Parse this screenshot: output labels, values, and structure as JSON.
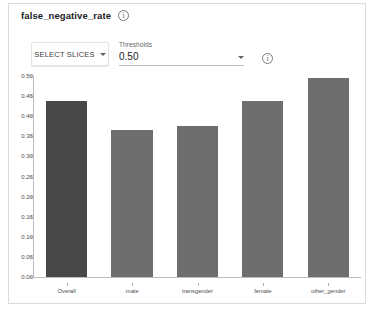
{
  "card": {
    "metric_title": "false_negative_rate",
    "title_info_icon": "info-icon"
  },
  "controls": {
    "select_slices_label": "SELECT SLICES",
    "select_slices_caret": "chevron-down-icon",
    "threshold_label": "Thresholds",
    "threshold_value": "0.50",
    "threshold_caret": "chevron-down-icon",
    "threshold_info_icon": "info-icon",
    "threshold_options": [
      "0.50"
    ]
  },
  "chart_data": {
    "type": "bar",
    "title": "false_negative_rate",
    "xlabel": "",
    "ylabel": "",
    "categories": [
      "Overall",
      "male",
      "transgender",
      "female",
      "other_gender"
    ],
    "values": [
      0.437,
      0.365,
      0.376,
      0.438,
      0.495
    ],
    "colors": [
      "#484848",
      "#6e6e6e",
      "#6e6e6e",
      "#6e6e6e",
      "#6e6e6e"
    ],
    "ylim": [
      0.0,
      0.5
    ],
    "ytick_values": [
      0.0,
      0.05,
      0.1,
      0.15,
      0.2,
      0.25,
      0.3,
      0.35,
      0.4,
      0.45,
      0.5
    ],
    "ytick_labels": [
      "0.00",
      "0.05",
      "0.10",
      "0.15",
      "0.20",
      "0.25",
      "0.30",
      "0.35",
      "0.40",
      "0.45",
      "0.50"
    ],
    "grid": false,
    "legend": null
  },
  "theme": {
    "bar_overall": "#484848",
    "bar_slice": "#6e6e6e",
    "axis": "#bdbdbd",
    "text": "#4d4d4d",
    "card_border": "#dcdcdc"
  }
}
